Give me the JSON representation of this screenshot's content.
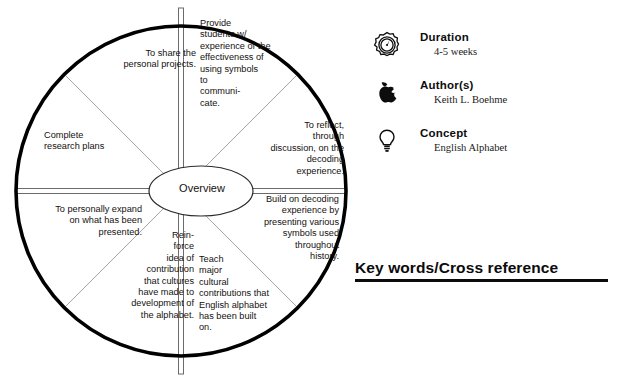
{
  "diagram": {
    "hub_label": "Overview",
    "segments": [
      {
        "id": "provide",
        "text": "Provide\nstudents w/\nexperience of the\neffectiveness of\nusing symbols\nto\ncommuni-\ncate."
      },
      {
        "id": "share",
        "text": "To share the\npersonal projects."
      },
      {
        "id": "complete",
        "text": "Complete\nresearch plans"
      },
      {
        "id": "expand",
        "text": "To personally expand\non what has been\npresented."
      },
      {
        "id": "reinforce",
        "text": "Rein-\nforce\nidea of\ncontribution\nthat cultures\nhave made to\ndevelopment of\nthe alphabet."
      },
      {
        "id": "teach",
        "text": "Teach\nmajor\ncultural\ncontributions that\nEnglish alphabet\nhas been built\non."
      },
      {
        "id": "build",
        "text": "Build on decoding\nexperience by\npresenting various\nsymbols used\nthroughout\nhistory."
      },
      {
        "id": "reflect",
        "text": "To reflect,\nthrough\ndiscussion, on the\ndecoding experience."
      }
    ]
  },
  "info_panel": {
    "rows": [
      {
        "icon": "stopwatch-icon",
        "label": "Duration",
        "value": "4-5 weeks"
      },
      {
        "icon": "apple-icon",
        "label": "Author(s)",
        "value": "Keith L. Boehme"
      },
      {
        "icon": "lightbulb-icon",
        "label": "Concept",
        "value": "English Alphabet"
      }
    ]
  },
  "keywords": {
    "title": "Key words/Cross reference"
  },
  "colors": {
    "ink": "#111111",
    "rim": "#000000",
    "spoke_thin": "#9a9a9a",
    "background": "#ffffff"
  }
}
